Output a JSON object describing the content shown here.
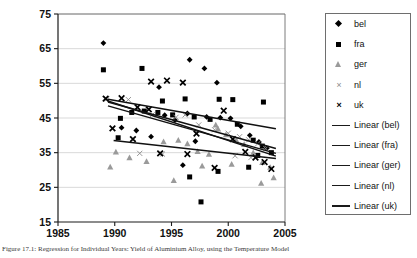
{
  "chart_data": {
    "type": "scatter",
    "title": "",
    "xlabel": "",
    "ylabel": "",
    "xlim": [
      1985,
      2005
    ],
    "ylim": [
      15,
      75
    ],
    "xticks": [
      1985,
      1990,
      1995,
      2000,
      2005
    ],
    "yticks": [
      15,
      25,
      35,
      45,
      55,
      65,
      75
    ],
    "grid": "horizontal",
    "legend_position": "right",
    "series": [
      {
        "name": "bel",
        "marker": "diamond",
        "color": "#000000",
        "points": [
          [
            1989.0,
            66.6
          ],
          [
            1993.9,
            53.9
          ],
          [
            1996.6,
            61.8
          ],
          [
            1997.9,
            59.3
          ],
          [
            1999.0,
            55.2
          ],
          [
            1990.6,
            42.2
          ],
          [
            1991.9,
            41.4
          ],
          [
            1994.4,
            45.8
          ],
          [
            1995.3,
            44.4
          ],
          [
            1996.4,
            46.3
          ],
          [
            1998.1,
            45.3
          ],
          [
            1999.3,
            45.1
          ],
          [
            2000.2,
            44.9
          ],
          [
            2001.1,
            42.6
          ],
          [
            2001.9,
            40.0
          ],
          [
            2002.7,
            38.1
          ],
          [
            2003.4,
            36.3
          ],
          [
            1996.0,
            31.4
          ],
          [
            1993.2,
            39.6
          ],
          [
            1997.1,
            38.3
          ]
        ]
      },
      {
        "name": "fra",
        "marker": "square",
        "color": "#000000",
        "points": [
          [
            1989.0,
            58.9
          ],
          [
            1992.4,
            59.3
          ],
          [
            1994.2,
            49.9
          ],
          [
            1996.2,
            50.5
          ],
          [
            1999.2,
            50.4
          ],
          [
            2000.4,
            50.3
          ],
          [
            2003.1,
            49.6
          ],
          [
            1990.5,
            44.9
          ],
          [
            1991.5,
            46.6
          ],
          [
            1992.6,
            47.0
          ],
          [
            1993.8,
            46.6
          ],
          [
            1995.1,
            45.9
          ],
          [
            1997.0,
            45.3
          ],
          [
            1998.4,
            44.6
          ],
          [
            2000.8,
            43.2
          ],
          [
            2002.2,
            38.6
          ],
          [
            2003.0,
            36.9
          ],
          [
            2003.8,
            35.0
          ],
          [
            1996.6,
            28.0
          ],
          [
            1999.1,
            29.6
          ],
          [
            2001.8,
            30.8
          ],
          [
            1997.6,
            20.8
          ],
          [
            1990.3,
            39.3
          ],
          [
            2002.6,
            34.2
          ]
        ]
      },
      {
        "name": "ger",
        "marker": "triangle",
        "color": "#9a9a9a",
        "points": [
          [
            1990.1,
            35.2
          ],
          [
            1991.3,
            33.6
          ],
          [
            1992.8,
            32.5
          ],
          [
            1994.3,
            38.2
          ],
          [
            1995.6,
            38.6
          ],
          [
            1996.4,
            37.6
          ],
          [
            1997.3,
            35.4
          ],
          [
            1998.3,
            34.6
          ],
          [
            1999.1,
            41.9
          ],
          [
            1999.8,
            40.2
          ],
          [
            2000.7,
            38.7
          ],
          [
            2001.4,
            37.4
          ],
          [
            2002.2,
            35.0
          ],
          [
            2003.0,
            32.2
          ],
          [
            2003.7,
            30.8
          ],
          [
            1995.2,
            27.0
          ],
          [
            1997.7,
            31.2
          ],
          [
            2000.3,
            31.7
          ],
          [
            2002.9,
            26.2
          ],
          [
            2004.0,
            27.8
          ],
          [
            1989.6,
            30.9
          ],
          [
            1998.9,
            43.0
          ]
        ]
      },
      {
        "name": "nl",
        "marker": "x-thin",
        "color": "#8c8c8c",
        "points": [
          [
            1989.3,
            50.5
          ],
          [
            1991.2,
            50.3
          ],
          [
            1993.3,
            45.9
          ],
          [
            1995.4,
            45.2
          ],
          [
            1996.2,
            45.9
          ],
          [
            1997.4,
            43.0
          ],
          [
            1998.8,
            41.6
          ],
          [
            2000.0,
            40.6
          ],
          [
            2001.0,
            39.6
          ],
          [
            2001.8,
            38.7
          ],
          [
            2002.6,
            37.6
          ],
          [
            2003.3,
            36.2
          ],
          [
            1994.2,
            34.6
          ],
          [
            1992.2,
            34.8
          ],
          [
            2000.6,
            34.1
          ],
          [
            2002.0,
            33.6
          ]
        ]
      },
      {
        "name": "uk",
        "marker": "x",
        "color": "#000000",
        "points": [
          [
            1993.2,
            55.5
          ],
          [
            1994.6,
            55.8
          ],
          [
            1996.0,
            55.2
          ],
          [
            1989.2,
            50.6
          ],
          [
            1990.6,
            50.7
          ],
          [
            1992.0,
            48.1
          ],
          [
            1993.0,
            47.5
          ],
          [
            1999.6,
            47.1
          ],
          [
            1989.8,
            42.0
          ],
          [
            1991.6,
            38.9
          ],
          [
            1994.0,
            34.8
          ],
          [
            1996.4,
            34.6
          ],
          [
            1997.2,
            40.5
          ],
          [
            2000.4,
            38.9
          ],
          [
            2001.5,
            35.2
          ],
          [
            2002.4,
            33.6
          ],
          [
            2003.2,
            32.3
          ],
          [
            2003.8,
            30.3
          ],
          [
            1998.8,
            30.6
          ]
        ]
      }
    ],
    "trendlines": [
      {
        "name": "Linear (bel)",
        "color": "#111111",
        "x0": 1989.4,
        "y0": 49.9,
        "x1": 2004.2,
        "y1": 34.0
      },
      {
        "name": "Linear (fra)",
        "color": "#111111",
        "x0": 1989.4,
        "y0": 48.5,
        "x1": 2004.2,
        "y1": 34.8
      },
      {
        "name": "Linear (ger)",
        "color": "#111111",
        "x0": 1989.9,
        "y0": 38.5,
        "x1": 2004.2,
        "y1": 33.3
      },
      {
        "name": "Linear (nl)",
        "color": "#111111",
        "x0": 1989.4,
        "y0": 49.6,
        "x1": 2004.2,
        "y1": 36.2
      },
      {
        "name": "Linear (uk)",
        "color": "#111111",
        "x0": 1989.4,
        "y0": 50.4,
        "x1": 2004.2,
        "y1": 41.9
      }
    ]
  },
  "axes": {
    "y_tick_labels": [
      "75",
      "65",
      "55",
      "45",
      "35",
      "25",
      "15"
    ],
    "x_tick_labels": [
      "1985",
      "1990",
      "1995",
      "2000",
      "2005"
    ]
  },
  "legend": {
    "markers": [
      {
        "label": "bel",
        "marker": "diamond"
      },
      {
        "label": "fra",
        "marker": "square"
      },
      {
        "label": "ger",
        "marker": "triangle"
      },
      {
        "label": "nl",
        "marker": "x-thin"
      },
      {
        "label": "uk",
        "marker": "x"
      }
    ],
    "lines": [
      {
        "label": "Linear (bel)"
      },
      {
        "label": "Linear (fra)"
      },
      {
        "label": "Linear (ger)"
      },
      {
        "label": "Linear (nl)"
      },
      {
        "label": "Linear (uk)"
      }
    ]
  },
  "caption": {
    "text": "Figure 17.1: Regression for Individual Years: Yield of Aluminium Alloy, using the Temperature Model"
  }
}
